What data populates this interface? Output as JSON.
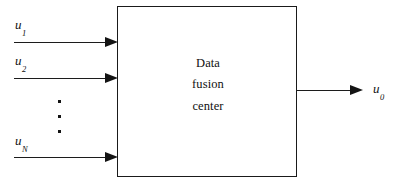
{
  "diagram": {
    "background_color": "#ffffff",
    "line_color": "#141414"
  },
  "block": {
    "name": "data-fusion-center",
    "lines": [
      "Data",
      "fusion",
      "center"
    ]
  },
  "inputs": [
    {
      "label_base": "u",
      "label_sub": "1",
      "arrow_name": "input-arrow-u1"
    },
    {
      "label_base": "u",
      "label_sub": "2",
      "arrow_name": "input-arrow-u2"
    },
    {
      "label_base": "u",
      "label_sub": "N",
      "arrow_name": "input-arrow-uN"
    }
  ],
  "output": {
    "label_base": "u",
    "label_sub": "0",
    "arrow_name": "output-arrow-u0"
  },
  "ellipsis": {
    "name": "vertical-ellipsis",
    "dot_count": 3,
    "meaning": "..."
  }
}
